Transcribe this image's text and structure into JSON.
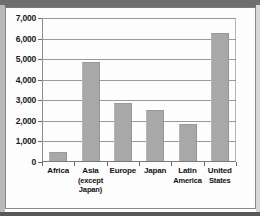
{
  "chart_data": {
    "type": "bar",
    "title": "",
    "subtitle": "",
    "xlabel": "",
    "ylabel": "",
    "categories": [
      "Africa",
      "Asia (except Japan)",
      "Europe",
      "Japan",
      "Latin America",
      "United States"
    ],
    "category_lines": [
      [
        "Africa"
      ],
      [
        "Asia",
        "(except",
        "Japan)"
      ],
      [
        "Europe"
      ],
      [
        "Japan"
      ],
      [
        "Latin",
        "America"
      ],
      [
        "United",
        "States"
      ]
    ],
    "values": [
      450,
      4800,
      2800,
      2500,
      1800,
      6200
    ],
    "ylim": [
      0,
      7000
    ],
    "yticks": [
      0,
      1000,
      2000,
      3000,
      4000,
      5000,
      6000,
      7000
    ],
    "ytick_labels": [
      "0",
      "1,000",
      "2,000",
      "3,000",
      "4,000",
      "5,000",
      "6,000",
      "7,000"
    ],
    "grid": true,
    "grid_axis": "y",
    "legend": false,
    "bar_color": "#a8a8a8",
    "axis_color": "#8c8c8c",
    "grid_color": "#9a9a9a",
    "text_color": "#111111",
    "background": "#ffffff"
  }
}
